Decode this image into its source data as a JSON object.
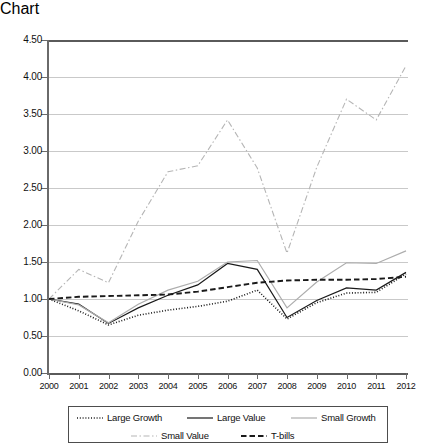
{
  "chart_data": {
    "type": "line",
    "title": "",
    "xlabel": "",
    "ylabel": "",
    "x": [
      2000,
      2001,
      2002,
      2003,
      2004,
      2005,
      2006,
      2007,
      2008,
      2009,
      2010,
      2011,
      2012
    ],
    "xtick_labels": [
      "2000",
      "2001",
      "2002",
      "2003",
      "2004",
      "2005",
      "2006",
      "2007",
      "2008",
      "2009",
      "2010",
      "2011",
      "2012"
    ],
    "ytick_labels": [
      "0.00",
      "0.50",
      "1.00",
      "1.50",
      "2.00",
      "2.50",
      "3.00",
      "3.50",
      "4.00",
      "4.50"
    ],
    "ylim": [
      0.0,
      4.5
    ],
    "ytick_step": 0.5,
    "xlim": [
      2000,
      2012
    ],
    "grid": "horizontal",
    "legend_position": "bottom",
    "series": [
      {
        "name": "Large Growth",
        "style": "dotted",
        "color": "#1a1a1a",
        "values": [
          1.0,
          0.84,
          0.65,
          0.78,
          0.85,
          0.9,
          0.97,
          1.12,
          0.73,
          0.95,
          1.08,
          1.09,
          1.34
        ]
      },
      {
        "name": "Large Value",
        "style": "solid",
        "color": "#1a1a1a",
        "values": [
          1.0,
          0.93,
          0.67,
          0.88,
          1.05,
          1.19,
          1.48,
          1.4,
          0.75,
          0.98,
          1.15,
          1.12,
          1.36
        ]
      },
      {
        "name": "Small Growth",
        "style": "solid",
        "color": "#adadad",
        "values": [
          1.0,
          0.92,
          0.68,
          0.93,
          1.12,
          1.24,
          1.5,
          1.52,
          0.88,
          1.23,
          1.49,
          1.48,
          1.65
        ]
      },
      {
        "name": "Small Value",
        "style": "dashdot",
        "color": "#b5b5b5",
        "values": [
          1.0,
          1.4,
          1.22,
          2.05,
          2.72,
          2.8,
          3.42,
          2.77,
          1.62,
          2.78,
          3.7,
          3.42,
          4.15
        ]
      },
      {
        "name": "T-bills",
        "style": "dashed",
        "color": "#1a1a1a",
        "values": [
          1.0,
          1.03,
          1.04,
          1.05,
          1.06,
          1.1,
          1.16,
          1.22,
          1.25,
          1.26,
          1.26,
          1.27,
          1.3
        ]
      }
    ]
  },
  "legend": {
    "row1": [
      {
        "label": "Large Growth",
        "style": "dotted",
        "color": "#1a1a1a"
      },
      {
        "label": "Large Value",
        "style": "solid",
        "color": "#1a1a1a"
      },
      {
        "label": "Small Growth",
        "style": "solid",
        "color": "#adadad"
      }
    ],
    "row2": [
      {
        "label": "Small Value",
        "style": "dashdot",
        "color": "#b5b5b5"
      },
      {
        "label": "T-bills",
        "style": "dashed",
        "color": "#1a1a1a"
      }
    ]
  }
}
